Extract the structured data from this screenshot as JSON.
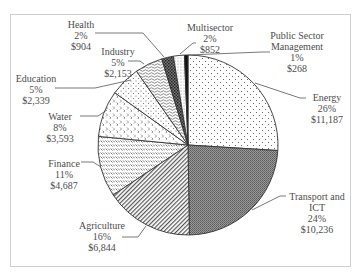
{
  "chart_data": {
    "type": "pie",
    "title": "",
    "start_angle_deg": 0,
    "direction": "clockwise",
    "slices": [
      {
        "name": "Energy",
        "label": [
          "Energy"
        ],
        "percent": 26,
        "value": 11187,
        "value_label": "$11,187",
        "pattern": "sparse-dots"
      },
      {
        "name": "Transport and ICT",
        "label": [
          "Transport and",
          "ICT"
        ],
        "percent": 24,
        "value": 10236,
        "value_label": "$10,236",
        "pattern": "dark-stipple"
      },
      {
        "name": "Agriculture",
        "label": [
          "Agriculture"
        ],
        "percent": 16,
        "value": 6844,
        "value_label": "$6,844",
        "pattern": "diagonal-hatch"
      },
      {
        "name": "Finance",
        "label": [
          "Finance"
        ],
        "percent": 11,
        "value": 4687,
        "value_label": "$4,687",
        "pattern": "dash-rows"
      },
      {
        "name": "Water",
        "label": [
          "Water"
        ],
        "percent": 8,
        "value": 3593,
        "value_label": "$3,593",
        "pattern": "chevrons"
      },
      {
        "name": "Education",
        "label": [
          "Education"
        ],
        "percent": 5,
        "value": 2339,
        "value_label": "$2,339",
        "pattern": "offset-dots"
      },
      {
        "name": "Industry",
        "label": [
          "Industry"
        ],
        "percent": 5,
        "value": 2153,
        "value_label": "$2,153",
        "pattern": "waves"
      },
      {
        "name": "Health",
        "label": [
          "Health"
        ],
        "percent": 2,
        "value": 904,
        "value_label": "$904",
        "pattern": "dark-crosshatch"
      },
      {
        "name": "Multisector",
        "label": [
          "Multisector"
        ],
        "percent": 2,
        "value": 852,
        "value_label": "$852",
        "pattern": "light-dots"
      },
      {
        "name": "Public Sector Management",
        "label": [
          "Public Sector",
          "Management"
        ],
        "percent": 1,
        "value": 268,
        "value_label": "$268",
        "pattern": "solid-black"
      }
    ],
    "legend": "none (direct labels with leader lines)"
  },
  "labels": {
    "energy": {
      "line1": "Energy",
      "pct": "26%",
      "val": "$11,187"
    },
    "transport": {
      "line1": "Transport and",
      "line2": "ICT",
      "pct": "24%",
      "val": "$10,236"
    },
    "agriculture": {
      "line1": "Agriculture",
      "pct": "16%",
      "val": "$6,844"
    },
    "finance": {
      "line1": "Finance",
      "pct": "11%",
      "val": "$4,687"
    },
    "water": {
      "line1": "Water",
      "pct": "8%",
      "val": "$3,593"
    },
    "education": {
      "line1": "Education",
      "pct": "5%",
      "val": "$2,339"
    },
    "industry": {
      "line1": "Industry",
      "pct": "5%",
      "val": "$2,153"
    },
    "health": {
      "line1": "Health",
      "pct": "2%",
      "val": "$904"
    },
    "multisector": {
      "line1": "Multisector",
      "pct": "2%",
      "val": "$852"
    },
    "psm": {
      "line1": "Public Sector",
      "line2": "Management",
      "pct": "1%",
      "val": "$268"
    }
  }
}
